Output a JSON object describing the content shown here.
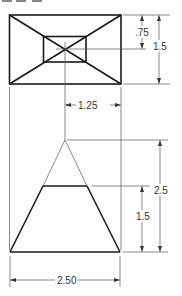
{
  "drawing": {
    "type": "orthographic projection",
    "views": [
      "top",
      "front"
    ],
    "colors": {
      "object_line": "#1a1a1a",
      "dimension_line": "#555555",
      "text": "#333333"
    }
  },
  "dimensions": {
    "inner_height": ".75",
    "outer_height": "1.5",
    "offset_width": "1.25",
    "total_height": "2.5",
    "frustum_height": "1.5",
    "base_width": "2.50"
  }
}
